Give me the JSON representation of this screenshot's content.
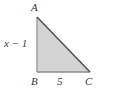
{
  "figure": {
    "type": "right-triangle-geometry-diagram",
    "fill_color": "#d4d4d4",
    "stroke_color": "#555555",
    "leg_stroke_color": "#9a9a9a",
    "background_color": "#ffffff",
    "label_color": "#3a3a3a",
    "vertices": {
      "A": {
        "label": "A",
        "x": 37,
        "y": 17
      },
      "B": {
        "label": "B",
        "x": 37,
        "y": 72
      },
      "C": {
        "label": "C",
        "x": 90,
        "y": 72
      }
    },
    "side_labels": {
      "base": "5",
      "vertical_leg": "x − 1"
    },
    "right_angle_at": "B"
  }
}
